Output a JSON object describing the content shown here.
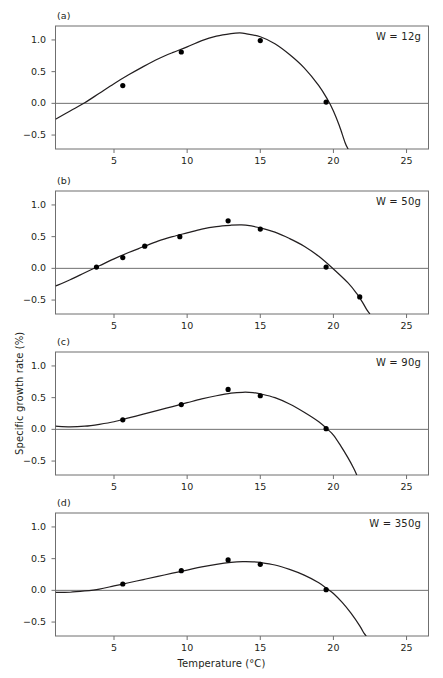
{
  "figure": {
    "xlabel": "Temperature (°C)",
    "ylabel": "Specific growth rate (%)",
    "background": "#ffffff",
    "ink": "#231f20",
    "frame_color": "#6f6f6f",
    "curve_color": "#231f20",
    "marker_color": "#000000"
  },
  "chart_data": {
    "type": "scatter",
    "title": "",
    "xlabel": "Temperature (°C)",
    "ylabel": "Specific growth rate (%)",
    "xlim": [
      1.0,
      26.5
    ],
    "ylim": [
      -0.72,
      1.22
    ],
    "xticks": [
      5,
      10,
      15,
      20,
      25
    ],
    "yticks": [
      -0.5,
      0.0,
      0.5,
      1.0
    ],
    "ytick_labels": [
      "−0.5",
      "0.0",
      "0.5",
      "1.0"
    ],
    "grid": false,
    "legend": "none",
    "zero_reference_line": true,
    "panels": [
      {
        "tag": "(a)",
        "annotation": "W = 12g",
        "weight_g": 12,
        "points": [
          {
            "x": 5.6,
            "y": 0.28
          },
          {
            "x": 9.6,
            "y": 0.81
          },
          {
            "x": 15.0,
            "y": 0.99
          },
          {
            "x": 19.5,
            "y": 0.02
          }
        ],
        "curve": [
          {
            "x": 1.0,
            "y": -0.25
          },
          {
            "x": 2.0,
            "y": -0.12
          },
          {
            "x": 3.0,
            "y": 0.01
          },
          {
            "x": 4.0,
            "y": 0.16
          },
          {
            "x": 5.0,
            "y": 0.31
          },
          {
            "x": 6.0,
            "y": 0.45
          },
          {
            "x": 7.0,
            "y": 0.58
          },
          {
            "x": 8.0,
            "y": 0.7
          },
          {
            "x": 9.0,
            "y": 0.8
          },
          {
            "x": 10.0,
            "y": 0.89
          },
          {
            "x": 11.0,
            "y": 0.99
          },
          {
            "x": 12.0,
            "y": 1.06
          },
          {
            "x": 13.0,
            "y": 1.1
          },
          {
            "x": 13.6,
            "y": 1.11
          },
          {
            "x": 14.0,
            "y": 1.1
          },
          {
            "x": 15.0,
            "y": 1.05
          },
          {
            "x": 16.0,
            "y": 0.94
          },
          {
            "x": 17.0,
            "y": 0.77
          },
          {
            "x": 18.0,
            "y": 0.56
          },
          {
            "x": 19.0,
            "y": 0.28
          },
          {
            "x": 19.6,
            "y": 0.06
          },
          {
            "x": 20.0,
            "y": -0.12
          },
          {
            "x": 20.4,
            "y": -0.35
          },
          {
            "x": 20.8,
            "y": -0.62
          },
          {
            "x": 21.0,
            "y": -0.72
          }
        ]
      },
      {
        "tag": "(b)",
        "annotation": "W = 50g",
        "weight_g": 50,
        "points": [
          {
            "x": 3.8,
            "y": 0.02
          },
          {
            "x": 5.6,
            "y": 0.17
          },
          {
            "x": 7.1,
            "y": 0.35
          },
          {
            "x": 9.5,
            "y": 0.5
          },
          {
            "x": 12.8,
            "y": 0.75
          },
          {
            "x": 15.0,
            "y": 0.62
          },
          {
            "x": 19.5,
            "y": 0.02
          },
          {
            "x": 21.8,
            "y": -0.45
          }
        ],
        "curve": [
          {
            "x": 1.0,
            "y": -0.28
          },
          {
            "x": 2.0,
            "y": -0.18
          },
          {
            "x": 3.0,
            "y": -0.07
          },
          {
            "x": 4.0,
            "y": 0.04
          },
          {
            "x": 5.0,
            "y": 0.15
          },
          {
            "x": 6.0,
            "y": 0.25
          },
          {
            "x": 7.0,
            "y": 0.34
          },
          {
            "x": 8.0,
            "y": 0.43
          },
          {
            "x": 9.0,
            "y": 0.5
          },
          {
            "x": 10.0,
            "y": 0.56
          },
          {
            "x": 11.0,
            "y": 0.62
          },
          {
            "x": 12.0,
            "y": 0.66
          },
          {
            "x": 13.0,
            "y": 0.68
          },
          {
            "x": 13.6,
            "y": 0.685
          },
          {
            "x": 14.0,
            "y": 0.68
          },
          {
            "x": 15.0,
            "y": 0.64
          },
          {
            "x": 16.0,
            "y": 0.57
          },
          {
            "x": 17.0,
            "y": 0.47
          },
          {
            "x": 18.0,
            "y": 0.35
          },
          {
            "x": 19.0,
            "y": 0.19
          },
          {
            "x": 20.0,
            "y": -0.01
          },
          {
            "x": 21.0,
            "y": -0.23
          },
          {
            "x": 21.6,
            "y": -0.4
          },
          {
            "x": 22.0,
            "y": -0.54
          },
          {
            "x": 22.3,
            "y": -0.66
          },
          {
            "x": 22.5,
            "y": -0.72
          }
        ]
      },
      {
        "tag": "(c)",
        "annotation": "W = 90g",
        "weight_g": 90,
        "points": [
          {
            "x": 5.6,
            "y": 0.15
          },
          {
            "x": 9.6,
            "y": 0.39
          },
          {
            "x": 12.8,
            "y": 0.63
          },
          {
            "x": 15.0,
            "y": 0.53
          },
          {
            "x": 19.5,
            "y": 0.01
          }
        ],
        "curve": [
          {
            "x": 1.0,
            "y": 0.05
          },
          {
            "x": 2.0,
            "y": 0.04
          },
          {
            "x": 3.0,
            "y": 0.05
          },
          {
            "x": 4.0,
            "y": 0.08
          },
          {
            "x": 5.0,
            "y": 0.12
          },
          {
            "x": 6.0,
            "y": 0.18
          },
          {
            "x": 7.0,
            "y": 0.24
          },
          {
            "x": 8.0,
            "y": 0.3
          },
          {
            "x": 9.0,
            "y": 0.36
          },
          {
            "x": 10.0,
            "y": 0.42
          },
          {
            "x": 11.0,
            "y": 0.48
          },
          {
            "x": 12.0,
            "y": 0.53
          },
          {
            "x": 13.0,
            "y": 0.57
          },
          {
            "x": 13.8,
            "y": 0.585
          },
          {
            "x": 14.5,
            "y": 0.58
          },
          {
            "x": 15.0,
            "y": 0.56
          },
          {
            "x": 16.0,
            "y": 0.5
          },
          {
            "x": 17.0,
            "y": 0.4
          },
          {
            "x": 18.0,
            "y": 0.27
          },
          {
            "x": 19.0,
            "y": 0.12
          },
          {
            "x": 19.6,
            "y": 0.0
          },
          {
            "x": 20.0,
            "y": -0.09
          },
          {
            "x": 20.5,
            "y": -0.26
          },
          {
            "x": 21.0,
            "y": -0.45
          },
          {
            "x": 21.4,
            "y": -0.62
          },
          {
            "x": 21.6,
            "y": -0.72
          }
        ]
      },
      {
        "tag": "(d)",
        "annotation": "W = 350g",
        "weight_g": 350,
        "points": [
          {
            "x": 5.6,
            "y": 0.1
          },
          {
            "x": 9.6,
            "y": 0.31
          },
          {
            "x": 12.8,
            "y": 0.48
          },
          {
            "x": 15.0,
            "y": 0.41
          },
          {
            "x": 19.5,
            "y": 0.01
          }
        ],
        "curve": [
          {
            "x": 1.0,
            "y": -0.03
          },
          {
            "x": 2.0,
            "y": -0.03
          },
          {
            "x": 3.0,
            "y": -0.01
          },
          {
            "x": 4.0,
            "y": 0.02
          },
          {
            "x": 5.0,
            "y": 0.07
          },
          {
            "x": 6.0,
            "y": 0.12
          },
          {
            "x": 7.0,
            "y": 0.17
          },
          {
            "x": 8.0,
            "y": 0.22
          },
          {
            "x": 9.0,
            "y": 0.27
          },
          {
            "x": 10.0,
            "y": 0.32
          },
          {
            "x": 11.0,
            "y": 0.37
          },
          {
            "x": 12.0,
            "y": 0.41
          },
          {
            "x": 13.0,
            "y": 0.44
          },
          {
            "x": 13.8,
            "y": 0.452
          },
          {
            "x": 14.5,
            "y": 0.45
          },
          {
            "x": 15.0,
            "y": 0.44
          },
          {
            "x": 16.0,
            "y": 0.4
          },
          {
            "x": 17.0,
            "y": 0.33
          },
          {
            "x": 18.0,
            "y": 0.24
          },
          {
            "x": 19.0,
            "y": 0.12
          },
          {
            "x": 19.6,
            "y": 0.02
          },
          {
            "x": 20.0,
            "y": -0.05
          },
          {
            "x": 20.6,
            "y": -0.19
          },
          {
            "x": 21.2,
            "y": -0.36
          },
          {
            "x": 21.8,
            "y": -0.56
          },
          {
            "x": 22.1,
            "y": -0.68
          },
          {
            "x": 22.25,
            "y": -0.72
          }
        ]
      }
    ]
  }
}
